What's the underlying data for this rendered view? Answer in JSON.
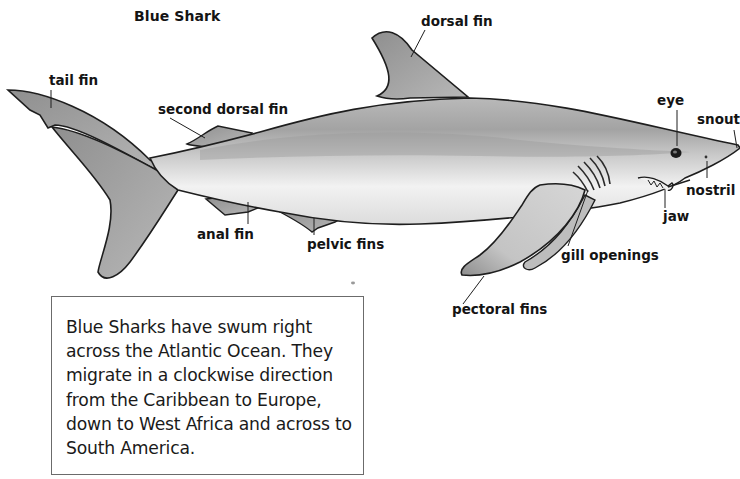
{
  "diagram": {
    "title": "Blue Shark",
    "labels": {
      "dorsal_fin": "dorsal fin",
      "tail_fin": "tail fin",
      "second_dorsal_fin": "second dorsal fin",
      "eye": "eye",
      "snout": "snout",
      "nostril": "nostril",
      "jaw": "jaw",
      "anal_fin": "anal fin",
      "pelvic_fins": "pelvic fins",
      "gill_openings": "gill openings",
      "pectoral_fins": "pectoral fins"
    },
    "colors": {
      "body_dark": "#8a8a8a",
      "body_light": "#e6e6e6",
      "fin": "#9a9a9a",
      "outline": "#1e1e1e",
      "text": "#141414"
    }
  },
  "info_box": {
    "text": "Blue Sharks have swum right across the Atlantic Ocean. They migrate in a clockwise direction from the Caribbean to Europe, down to West Africa and across to South America."
  }
}
